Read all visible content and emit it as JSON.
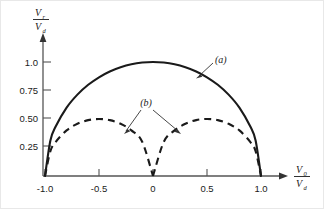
{
  "figure": {
    "background_color": "#ffffff",
    "ink_color": "#1a1a1a",
    "axis_color": "#555555"
  },
  "axes": {
    "y_axis": {
      "label_numerator": "V",
      "label_numerator_sub": "r",
      "label_denominator": "V",
      "label_denominator_sub": "d",
      "ticks": [
        "1.0",
        "0.75",
        "0.50",
        "0.25"
      ],
      "tick_values": [
        1.0,
        0.75,
        0.5,
        0.25
      ],
      "range": [
        0,
        1.1
      ]
    },
    "x_axis": {
      "label_numerator": "V",
      "label_numerator_sub": "0",
      "label_denominator": "V",
      "label_denominator_sub": "d",
      "ticks": [
        "-1.0",
        "-0.5",
        "0",
        "0.5",
        "1.0"
      ],
      "tick_values": [
        -1.0,
        -0.5,
        0,
        0.5,
        1.0
      ],
      "range": [
        -1.15,
        1.15
      ]
    }
  },
  "annotations": {
    "curve_a_label": "(a)",
    "curve_b_label": "(b)"
  },
  "chart_data": {
    "type": "line",
    "title": "",
    "xlabel": "V0/Vd",
    "ylabel": "Vr/Vd",
    "xlim": [
      -1.15,
      1.15
    ],
    "ylim": [
      0,
      1.1
    ],
    "grid": false,
    "legend": "inline-annotations",
    "series": [
      {
        "name": "(a)",
        "style": "solid",
        "linewidth": 2,
        "color": "#1a1a1a",
        "description": "Single arch peaking at 1.0 at x=0, zero at x=-1.0 and x=1.0",
        "x": [
          -1.0,
          -0.95,
          -0.9,
          -0.8,
          -0.7,
          -0.6,
          -0.5,
          -0.4,
          -0.3,
          -0.2,
          -0.1,
          0.0,
          0.1,
          0.2,
          0.3,
          0.4,
          0.5,
          0.6,
          0.7,
          0.8,
          0.9,
          0.95,
          1.0
        ],
        "y": [
          0.0,
          0.312,
          0.436,
          0.6,
          0.714,
          0.8,
          0.866,
          0.917,
          0.954,
          0.98,
          0.995,
          1.0,
          0.995,
          0.98,
          0.954,
          0.917,
          0.866,
          0.8,
          0.714,
          0.6,
          0.436,
          0.312,
          0.0
        ]
      },
      {
        "name": "(b)",
        "style": "dashed",
        "linewidth": 2,
        "color": "#1a1a1a",
        "description": "Two arches each peaking at 0.50, at x=-0.5 and x=0.5; zero at x=-1.0, x=0, x=1.0",
        "x": [
          -1.0,
          -0.95,
          -0.9,
          -0.8,
          -0.7,
          -0.6,
          -0.5,
          -0.4,
          -0.3,
          -0.2,
          -0.1,
          0.0,
          0.1,
          0.2,
          0.3,
          0.4,
          0.5,
          0.6,
          0.7,
          0.8,
          0.9,
          0.95,
          1.0
        ],
        "y": [
          0.0,
          0.218,
          0.3,
          0.4,
          0.458,
          0.49,
          0.5,
          0.49,
          0.458,
          0.4,
          0.3,
          0.0,
          0.3,
          0.4,
          0.458,
          0.49,
          0.5,
          0.49,
          0.458,
          0.4,
          0.3,
          0.218,
          0.0
        ]
      }
    ]
  }
}
